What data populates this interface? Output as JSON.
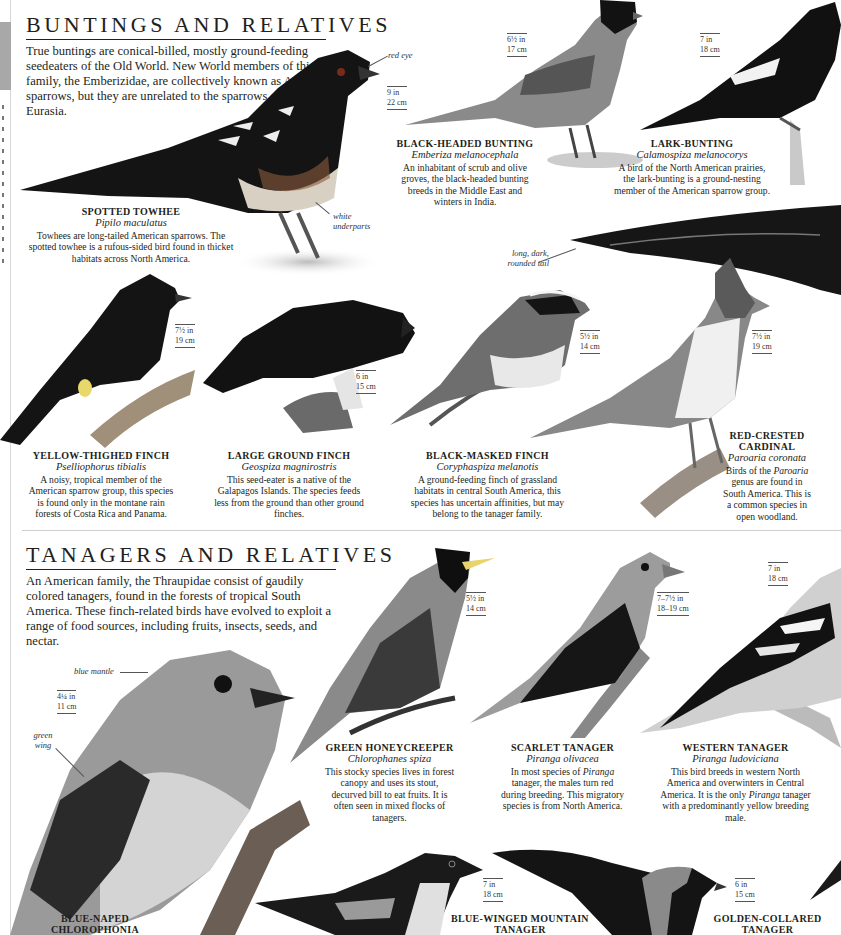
{
  "side_strip": {
    "tab_color": "#a8a8a8"
  },
  "buntings": {
    "title": "BUNTINGS AND RELATIVES",
    "intro": "True buntings are conical-billed, mostly ground-feeding seedeaters of the Old World. New World members of this family, the Emberizidae, are collectively known as American sparrows, but they are unrelated to the sparrows of Africa and Eurasia.",
    "species": [
      {
        "name": "SPOTTED TOWHEE",
        "latin": "Pipilo maculatus",
        "desc": "Towhees are long-tailed American sparrows. The spotted towhee is a rufous-sided bird found in thicket habitats across North America.",
        "size_in": "9 in",
        "size_cm": "22 cm",
        "annotations": [
          "red eye",
          "white underparts"
        ]
      },
      {
        "name": "BLACK-HEADED BUNTING",
        "latin": "Emberiza melanocephala",
        "desc": "An inhabitant of scrub and olive groves, the black-headed bunting breeds in the Middle East and winters in India.",
        "size_in": "6½ in",
        "size_cm": "17 cm"
      },
      {
        "name": "LARK-BUNTING",
        "latin": "Calamospiza melanocorys",
        "desc": "A bird of the North American prairies, the lark-bunting is a ground-nesting member of the American sparrow group.",
        "size_in": "7 in",
        "size_cm": "18 cm",
        "annotations": [
          "long, dark, rounded tail"
        ]
      },
      {
        "name": "YELLOW-THIGHED FINCH",
        "latin": "Pselliophorus tibialis",
        "desc": "A noisy, tropical member of the American sparrow group, this species is found only in the montane rain forests of Costa Rica and Panama.",
        "size_in": "7½ in",
        "size_cm": "19 cm"
      },
      {
        "name": "LARGE GROUND FINCH",
        "latin": "Geospiza magnirostris",
        "desc": "This seed-eater is a native of the Galapagos Islands. The species feeds less from the ground than other ground finches.",
        "size_in": "6 in",
        "size_cm": "15 cm"
      },
      {
        "name": "BLACK-MASKED FINCH",
        "latin": "Coryphaspiza melanotis",
        "desc": "A ground-feeding finch of grassland habitats in central South America, this species has uncertain affinities, but may belong to the tanager family.",
        "size_in": "5½ in",
        "size_cm": "14 cm"
      },
      {
        "name": "RED-CRESTED CARDINAL",
        "latin": "Paroaria coronata",
        "desc_parts": [
          "Birds of the ",
          "Paroaria",
          " genus are found in South America. This is a common species in open woodland."
        ],
        "size_in": "7½ in",
        "size_cm": "19 cm"
      }
    ]
  },
  "tanagers": {
    "title": "TANAGERS AND RELATIVES",
    "intro": "An American family, the Thraupidae consist of gaudily colored tanagers, found in the forests of tropical South America. These finch-related birds have evolved to exploit a range of food sources, including fruits, insects, seeds, and nectar.",
    "species": [
      {
        "name": "BLUE-NAPED CHLOROPHONIA",
        "size_in": "4¼ in",
        "size_cm": "11 cm",
        "annotations": [
          "blue mantle",
          "green wing"
        ]
      },
      {
        "name": "GREEN HONEYCREEPER",
        "latin": "Chlorophanes spiza",
        "desc": "This stocky species lives in forest canopy and uses its stout, decurved bill to eat fruits. It is often seen in mixed flocks of tanagers.",
        "size_in": "5½ in",
        "size_cm": "14 cm"
      },
      {
        "name": "SCARLET TANAGER",
        "latin": "Piranga olivacea",
        "desc_parts": [
          "In most species of ",
          "Piranga",
          " tanager, the males turn red during breeding. This migratory species is from North America."
        ],
        "size_in": "7–7½ in",
        "size_cm": "18–19 cm"
      },
      {
        "name": "WESTERN TANAGER",
        "latin": "Piranga ludoviciana",
        "desc_parts": [
          "This bird breeds in western North America and overwinters in Central America. It is the only ",
          "Piranga",
          " tanager with a predominantly yellow breeding male."
        ],
        "size_in": "7 in",
        "size_cm": "18 cm"
      },
      {
        "name": "BLUE-WINGED MOUNTAIN TANAGER",
        "size_in": "7 in",
        "size_cm": "18 cm"
      },
      {
        "name": "GOLDEN-COLLARED TANAGER",
        "size_in": "6 in",
        "size_cm": "15 cm"
      }
    ]
  },
  "colors": {
    "text": "#231f20",
    "rule": "#cfcfcf",
    "bird_dark": "#141414",
    "bird_mid": "#6a6a6a",
    "bird_light": "#b8b8b8"
  }
}
